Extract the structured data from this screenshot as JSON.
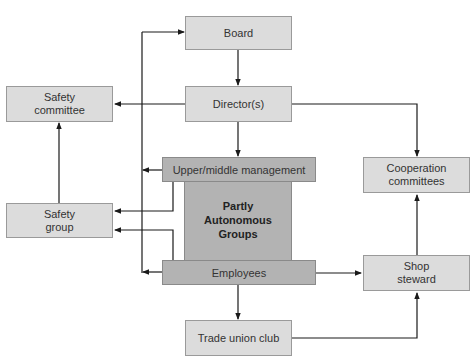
{
  "diagram": {
    "nodes": {
      "board": "Board",
      "directors": "Director(s)",
      "safety_committee": "Safety committee",
      "safety_group": "Safety group",
      "upper_middle_management": "Upper/middle management",
      "partly_autonomous_groups": "Partly Autonomous Groups",
      "employees": "Employees",
      "cooperation_committees": "Cooperation committees",
      "shop_steward": "Shop steward",
      "trade_union_club": "Trade union club"
    },
    "edges": [
      {
        "from": "Board",
        "to": "Director(s)"
      },
      {
        "from": "Director(s)",
        "to": "Safety committee"
      },
      {
        "from": "Director(s)",
        "to": "Cooperation committees"
      },
      {
        "from": "Director(s)",
        "to": "Upper/middle management"
      },
      {
        "from": "Safety group",
        "to": "Safety committee"
      },
      {
        "from": "Upper/middle management",
        "to": "Safety group"
      },
      {
        "from": "Employees",
        "to": "Safety group"
      },
      {
        "from": "Upper/middle management",
        "to": "Partly Autonomous Groups"
      },
      {
        "from": "Employees",
        "to": "Partly Autonomous Groups"
      },
      {
        "from": "Left bus line",
        "to": "Board"
      },
      {
        "from": "Left bus line",
        "to": "Upper/middle management"
      },
      {
        "from": "Left bus line",
        "to": "Employees"
      },
      {
        "from": "Employees",
        "to": "Shop steward"
      },
      {
        "from": "Employees",
        "to": "Trade union club"
      },
      {
        "from": "Trade union club",
        "to": "Shop steward"
      },
      {
        "from": "Shop steward",
        "to": "Cooperation committees"
      }
    ]
  },
  "colors": {
    "box_fill": "#dcdcdc",
    "core_fill": "#b3b3b3",
    "line": "#1a1a1a"
  }
}
